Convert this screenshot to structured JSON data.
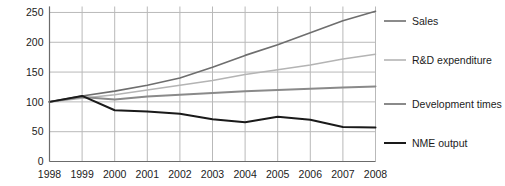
{
  "chart_data": {
    "type": "line",
    "title": "",
    "subtitle": "",
    "xlabel": "",
    "ylabel": "",
    "x": [
      1998,
      1999,
      2000,
      2001,
      2002,
      2003,
      2004,
      2005,
      2006,
      2007,
      2008
    ],
    "categories": [
      "1998",
      "1999",
      "2000",
      "2001",
      "2002",
      "2003",
      "2004",
      "2005",
      "2006",
      "2007",
      "2008"
    ],
    "xlim": [
      1998,
      2008
    ],
    "ylim": [
      0,
      260
    ],
    "y_ticks": [
      0,
      50,
      100,
      150,
      200,
      250
    ],
    "y_tick_labels": [
      "0",
      "50",
      "100",
      "150",
      "200",
      "250"
    ],
    "grid": true,
    "grid_x": true,
    "grid_y": true,
    "legend_position": "right",
    "series": [
      {
        "name": "Sales",
        "color": "#6e6e6e",
        "width": 1.6,
        "values": [
          100,
          110,
          118,
          128,
          140,
          158,
          178,
          196,
          216,
          236,
          252
        ]
      },
      {
        "name": "R&D expenditure",
        "color": "#b4b4b4",
        "width": 1.6,
        "values": [
          100,
          106,
          112,
          120,
          128,
          136,
          146,
          154,
          162,
          172,
          180
        ]
      },
      {
        "name": "Development times",
        "color": "#8a8a8a",
        "width": 2.0,
        "values": [
          100,
          108,
          104,
          109,
          112,
          115,
          118,
          120,
          122,
          124,
          126
        ]
      },
      {
        "name": "NME output",
        "color": "#1a1a1a",
        "width": 2.0,
        "values": [
          100,
          110,
          86,
          84,
          80,
          71,
          66,
          75,
          70,
          58,
          57
        ]
      }
    ]
  },
  "legend": {
    "items": [
      {
        "label": "Sales",
        "color": "#6e6e6e",
        "width": 1.6
      },
      {
        "label": "R&D expenditure",
        "color": "#b4b4b4",
        "width": 1.6
      },
      {
        "label": "Development times",
        "color": "#8a8a8a",
        "width": 2.0
      },
      {
        "label": "NME output",
        "color": "#1a1a1a",
        "width": 2.0
      }
    ]
  },
  "style": {
    "background": "#ffffff",
    "grid_color": "#b9b9b9",
    "axis_color": "#6b6b6b",
    "text_color": "#1c1c1c"
  }
}
